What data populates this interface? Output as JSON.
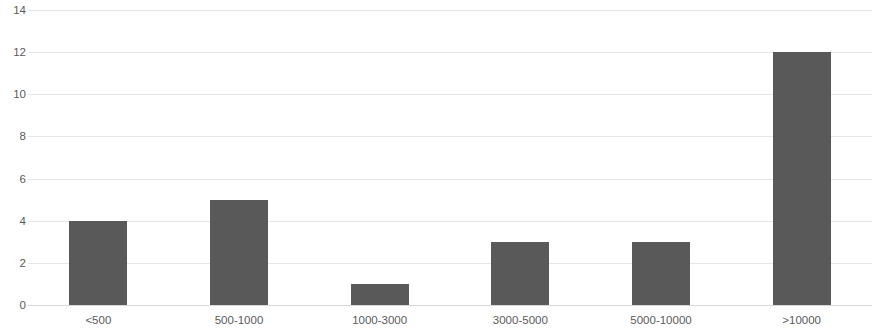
{
  "chart_data": {
    "type": "bar",
    "title": "",
    "subtitle": "",
    "xlabel": "",
    "ylabel": "",
    "categories": [
      "<500",
      "500-1000",
      "1000-3000",
      "3000-5000",
      "5000-10000",
      ">10000"
    ],
    "values": [
      4,
      5,
      1,
      3,
      3,
      12
    ],
    "ylim": [
      0,
      14
    ],
    "ytick_step": 2,
    "ytick_labels": [
      "0",
      "2",
      "4",
      "6",
      "8",
      "10",
      "12",
      "14"
    ],
    "grid": true,
    "grid_axis": "y",
    "legend": false,
    "legend_position": "none",
    "annotations": [],
    "data_labels": false
  },
  "style": {
    "bar_color": "#595959",
    "gridline_color": "#e6e6e6",
    "baseline_color": "#d9d9d9",
    "text_color": "#5a5a5a",
    "background_color": "#ffffff"
  }
}
